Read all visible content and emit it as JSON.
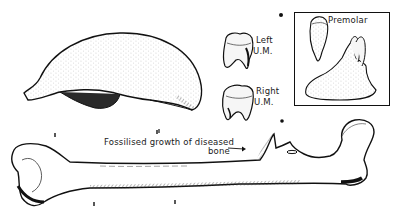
{
  "figure": {
    "background": "#ffffff",
    "ink": "#1a1a1a",
    "specimens": [
      {
        "id": "skullcap",
        "name": "Skull cap"
      },
      {
        "id": "left-molar",
        "name": "Left upper molar"
      },
      {
        "id": "right-molar",
        "name": "Right upper molar"
      },
      {
        "id": "premolar",
        "name": "Premolar"
      },
      {
        "id": "femur",
        "name": "Femur"
      }
    ],
    "labels": {
      "left_um_line1": "Left",
      "left_um_line2": "U.M.",
      "right_um_line1": "Right",
      "right_um_line2": "U.M.",
      "premolar": "Premolar",
      "growth_line1": "Fossilised growth of diseased",
      "growth_line2": "bone"
    }
  }
}
